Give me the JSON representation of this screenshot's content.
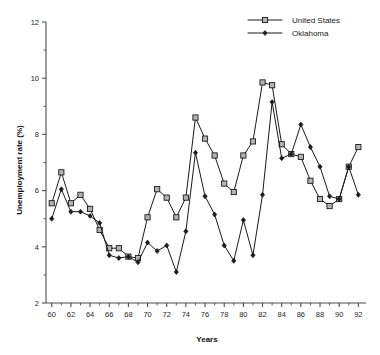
{
  "chart_data": {
    "type": "line",
    "title": "",
    "xlabel": "Years",
    "ylabel": "Unemployment rate (%)",
    "xlim": [
      59.4,
      92.8
    ],
    "ylim": [
      2,
      12
    ],
    "grid": false,
    "legend_position": "top-right",
    "x_major_ticks": [
      60,
      62,
      64,
      66,
      68,
      70,
      72,
      74,
      76,
      78,
      80,
      82,
      84,
      86,
      88,
      90,
      92
    ],
    "x_minor_ticks": [
      61,
      63,
      65,
      67,
      69,
      71,
      73,
      75,
      77,
      79,
      81,
      83,
      85,
      87,
      89,
      91
    ],
    "x_tick_labels": [
      "60",
      "62",
      "64",
      "66",
      "68",
      "70",
      "72",
      "74",
      "76",
      "78",
      "80",
      "82",
      "84",
      "86",
      "88",
      "90",
      "92"
    ],
    "y_major_ticks": [
      2,
      4,
      6,
      8,
      10,
      12
    ],
    "y_minor_ticks": [
      3,
      5,
      7,
      9,
      11
    ],
    "y_tick_labels": [
      "2",
      "4",
      "6",
      "8",
      "10",
      "12"
    ],
    "x": [
      60,
      61,
      62,
      63,
      64,
      65,
      66,
      67,
      68,
      69,
      70,
      71,
      72,
      73,
      74,
      75,
      76,
      77,
      78,
      79,
      80,
      81,
      82,
      83,
      84,
      85,
      86,
      87,
      88,
      89,
      90,
      91,
      92
    ],
    "series": [
      {
        "name": "United States",
        "marker": "open-square",
        "values": [
          5.55,
          6.65,
          5.55,
          5.85,
          5.35,
          4.6,
          3.95,
          3.95,
          3.65,
          3.6,
          5.05,
          6.05,
          5.75,
          5.05,
          5.75,
          8.6,
          7.85,
          7.25,
          6.25,
          5.95,
          7.25,
          7.75,
          9.85,
          9.75,
          7.65,
          7.3,
          7.2,
          6.35,
          5.7,
          5.45,
          5.7,
          6.85,
          7.55
        ]
      },
      {
        "name": "Oklahoma",
        "marker": "filled-diamond",
        "values": [
          5.0,
          6.05,
          5.25,
          5.25,
          5.1,
          4.85,
          3.7,
          3.6,
          3.65,
          3.45,
          4.15,
          3.85,
          4.05,
          3.1,
          4.55,
          7.35,
          5.8,
          5.15,
          4.05,
          3.5,
          4.95,
          3.7,
          5.85,
          9.15,
          7.15,
          7.3,
          8.35,
          7.55,
          6.85,
          5.8,
          5.7,
          6.85,
          5.85
        ]
      }
    ],
    "legend": [
      {
        "label": "United States",
        "marker": "open-square"
      },
      {
        "label": "Oklahoma",
        "marker": "filled-diamond"
      }
    ]
  },
  "colors": {
    "line": "#1a1a1a",
    "axis": "#4d4d4d",
    "square_fill": "#b3b3b3",
    "diamond_fill": "#1a1a1a",
    "background": "#ffffff"
  }
}
